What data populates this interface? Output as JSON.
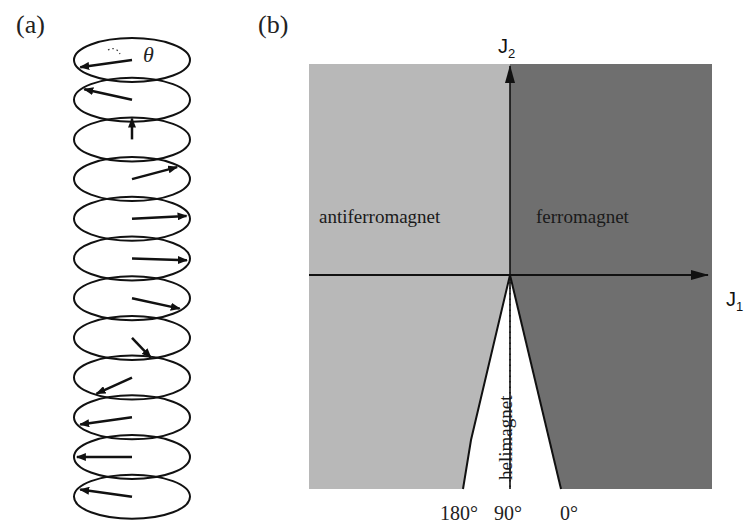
{
  "panels": {
    "a": {
      "label": "(a)",
      "angle_symbol": "θ",
      "spin_count": 12,
      "spin_angles_deg": [
        200,
        150,
        90,
        35,
        8,
        -5,
        -30,
        -70,
        -130,
        -160,
        180,
        160
      ]
    },
    "b": {
      "label": "(b)",
      "x_axis": {
        "label": "J",
        "sub": "1"
      },
      "y_axis": {
        "label": "J",
        "sub": "2"
      },
      "regions": {
        "antiferromagnet": "antiferromagnet",
        "ferromagnet": "ferromagnet",
        "helimagnet": "helimagnet"
      },
      "angle_ticks": [
        "180°",
        "90°",
        "0°"
      ],
      "colors": {
        "antiferromagnet": "#b8b8b8",
        "ferromagnet": "#6f6f6f",
        "helimagnet": "#ffffff"
      }
    }
  }
}
